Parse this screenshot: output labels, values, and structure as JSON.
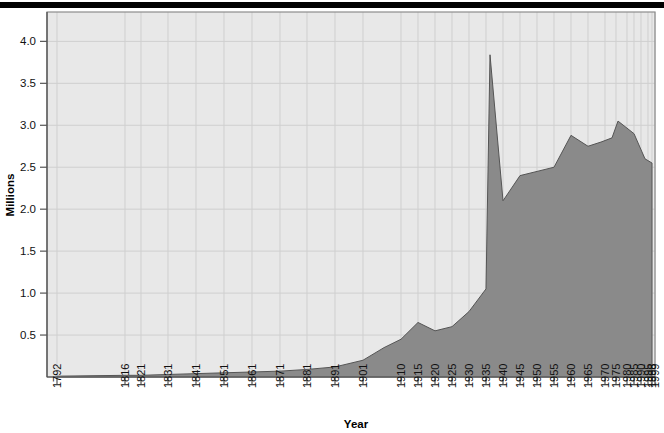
{
  "chart_data": {
    "type": "area",
    "title": "",
    "xlabel": "Year",
    "ylabel": "Millions",
    "grid": true,
    "legend": "none",
    "ylim": [
      0,
      4.35
    ],
    "y_ticks": [
      "0.5",
      "1.0",
      "1.5",
      "2.0",
      "2.5",
      "3.0",
      "3.5",
      "4.0"
    ],
    "y_tick_values": [
      0.5,
      1.0,
      1.5,
      2.0,
      2.5,
      3.0,
      3.5,
      4.0
    ],
    "x_tick_labels": [
      "1792",
      "1816",
      "1821",
      "1831",
      "1841",
      "1851",
      "1861",
      "1871",
      "1881",
      "1891",
      "1901",
      "1910",
      "1915",
      "1920",
      "1925",
      "1930",
      "1935",
      "1940",
      "1945",
      "1950",
      "1955",
      "1960",
      "1965",
      "1970",
      "1975",
      "1980",
      "1985",
      "1990",
      "1995",
      "1998",
      "1999"
    ],
    "categories": [
      "1792",
      "1816",
      "1821",
      "1831",
      "1841",
      "1851",
      "1861",
      "1871",
      "1881",
      "1891",
      "1901",
      "1910",
      "1915",
      "1920",
      "1925",
      "1930",
      "1935",
      "1940",
      "1945",
      "1950",
      "1955",
      "1960",
      "1965",
      "1970",
      "1975",
      "1980",
      "1985",
      "1990",
      "1995",
      "1998",
      "1999"
    ],
    "values": [
      0.01,
      0.02,
      0.02,
      0.03,
      0.04,
      0.05,
      0.06,
      0.07,
      0.09,
      0.12,
      0.2,
      0.35,
      0.45,
      0.65,
      0.55,
      0.6,
      0.78,
      1.05,
      3.84,
      2.1,
      2.4,
      2.45,
      2.5,
      2.88,
      2.75,
      2.8,
      2.85,
      3.05,
      2.9,
      2.6,
      2.55
    ],
    "colors": {
      "area_fill": "#8a8a8a",
      "area_stroke": "#555555",
      "plot_background": "#e8e8e8",
      "gridline": "#cfcfcf",
      "axis": "#555555",
      "page_background": "#ffffff",
      "top_rule": "#000000"
    }
  }
}
